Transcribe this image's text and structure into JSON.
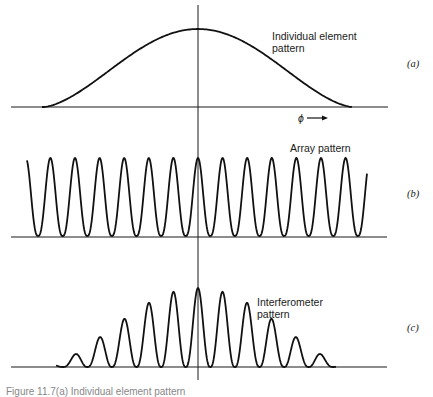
{
  "figure": {
    "panels": [
      {
        "id": "a",
        "tag": "(a)",
        "label_line1": "Individual element",
        "label_line2": "pattern",
        "axis_label": "ϕ ⟶"
      },
      {
        "id": "b",
        "tag": "(b)",
        "label_line1": "Array pattern"
      },
      {
        "id": "c",
        "tag": "(c)",
        "label_line1": "Interferometer",
        "label_line2": "pattern"
      }
    ],
    "caption": "Figure 11.7(a) Individual element pattern"
  },
  "chart_data": [
    {
      "type": "line",
      "title": "Individual element pattern",
      "panel": "(a)",
      "xlabel": "ϕ",
      "description": "Single broad bell-shaped lobe centered at ϕ = 0",
      "x": [
        -1.0,
        -0.75,
        -0.5,
        -0.25,
        0,
        0.25,
        0.5,
        0.75,
        1.0
      ],
      "values": [
        0.0,
        0.16,
        0.52,
        0.87,
        1.0,
        0.87,
        0.52,
        0.16,
        0.0
      ]
    },
    {
      "type": "line",
      "title": "Array pattern",
      "panel": "(b)",
      "xlabel": "ϕ",
      "description": "13 equal-amplitude periodic fringes, central fringe at ϕ = 0",
      "peak_positions": [
        -6,
        -5,
        -4,
        -3,
        -2,
        -1,
        0,
        1,
        2,
        3,
        4,
        5,
        6
      ],
      "peak_values": [
        1,
        1,
        1,
        1,
        1,
        1,
        1,
        1,
        1,
        1,
        1,
        1,
        1
      ]
    },
    {
      "type": "line",
      "title": "Interferometer pattern",
      "panel": "(c)",
      "xlabel": "ϕ",
      "description": "Product of (a) and (b): fringes modulated by element pattern envelope",
      "peak_positions": [
        -6,
        -5,
        -4,
        -3,
        -2,
        -1,
        0,
        1,
        2,
        3,
        4,
        5,
        6
      ],
      "peak_values": [
        0.1,
        0.1,
        0.37,
        0.57,
        0.78,
        0.89,
        1.0,
        0.89,
        0.78,
        0.57,
        0.37,
        0.1,
        0.1
      ]
    }
  ]
}
